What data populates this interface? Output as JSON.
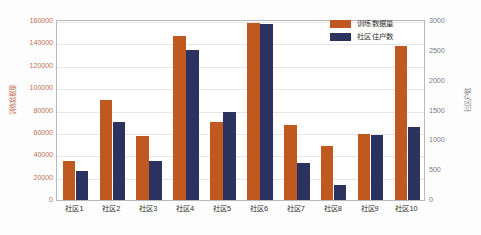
{
  "chart_data": {
    "type": "bar",
    "title": "",
    "xlabel": "",
    "grid": true,
    "legend_position": "top-right",
    "categories": [
      "社区1",
      "社区2",
      "社区3",
      "社区4",
      "社区5",
      "社区6",
      "社区7",
      "社区8",
      "社区9",
      "社区10"
    ],
    "series": [
      {
        "name": "训练数据量",
        "axis": "left",
        "color": "#c0591f",
        "values": [
          35000,
          89000,
          57000,
          147000,
          70000,
          158000,
          67000,
          48000,
          59000,
          138000
        ]
      },
      {
        "name": "社区住户数",
        "axis": "right",
        "color": "#2b3260",
        "values": [
          480,
          1310,
          660,
          2520,
          1470,
          2950,
          620,
          250,
          1090,
          1230
        ]
      }
    ],
    "left_axis": {
      "label": "训练数据量",
      "min": 0,
      "max": 160000,
      "step": 20000,
      "ticks": [
        "0",
        "20000",
        "40000",
        "60000",
        "80000",
        "100000",
        "120000",
        "140000",
        "160000"
      ],
      "color": "#c2725a"
    },
    "right_axis": {
      "label": "社区户数",
      "min": 0,
      "max": 3000,
      "step": 500,
      "ticks": [
        "0",
        "500",
        "1000",
        "1500",
        "2000",
        "2500",
        "3000"
      ],
      "color": "#7a7a86"
    }
  }
}
